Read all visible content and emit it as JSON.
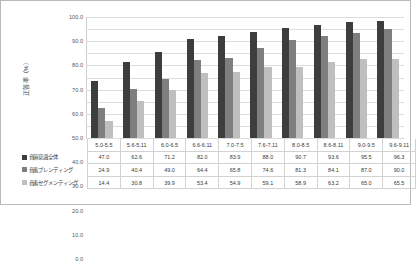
{
  "chart_data": {
    "type": "bar",
    "title": "",
    "xlabel": "",
    "ylabel": "正答率（%）",
    "ylim": [
      0,
      100
    ],
    "grid": true,
    "legend_position": "table-below",
    "categories": [
      "5.0-5.5",
      "5.6-5.11",
      "6.0-6.5",
      "6.6-6.11",
      "7.0-7.5",
      "7.6-7.11",
      "8.0-8.5",
      "8.6-8.11",
      "9.0-9.5",
      "9.6-9.11"
    ],
    "ytick_labels": [
      "100.0",
      "90.0",
      "80.0",
      "70.0",
      "60.0",
      "50.0",
      "40.0",
      "30.0",
      "20.0",
      "10.0",
      "0.0"
    ],
    "ytick_values": [
      100,
      90,
      80,
      70,
      60,
      50,
      40,
      30,
      20,
      10,
      0
    ],
    "series": [
      {
        "name": "音韻意識全体",
        "color": "#3d3d3d",
        "values": [
          47.0,
          62.6,
          71.2,
          82.0,
          83.9,
          88.0,
          90.7,
          93.6,
          95.5,
          96.3
        ],
        "labels": [
          "47.0",
          "62.6",
          "71.2",
          "82.0",
          "83.9",
          "88.0",
          "90.7",
          "93.6",
          "95.5",
          "96.3"
        ]
      },
      {
        "name": "音素ブレンディング",
        "color": "#7f7f7f",
        "values": [
          24.9,
          40.4,
          49.0,
          64.4,
          65.8,
          74.6,
          81.3,
          84.1,
          87.0,
          90.0
        ],
        "labels": [
          "24.9",
          "40.4",
          "49.0",
          "64.4",
          "65.8",
          "74.6",
          "81.3",
          "84.1",
          "87.0",
          "90.0"
        ]
      },
      {
        "name": "音素セグメンティング",
        "color": "#bfbfbf",
        "values": [
          14.4,
          30.8,
          39.9,
          53.4,
          54.9,
          59.1,
          58.9,
          63.2,
          65.0,
          65.5
        ],
        "labels": [
          "14.4",
          "30.8",
          "39.9",
          "53.4",
          "54.9",
          "59.1",
          "58.9",
          "63.2",
          "65.0",
          "65.5"
        ]
      }
    ]
  }
}
